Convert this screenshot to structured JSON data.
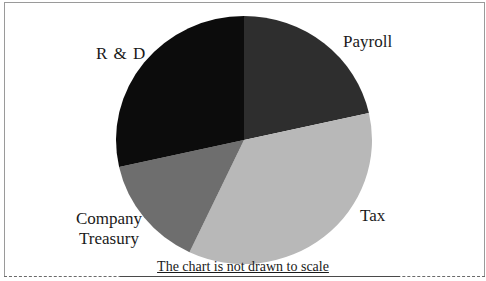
{
  "chart_data": {
    "type": "pie",
    "title": "",
    "categories": [
      "Payroll",
      "Tax",
      "Company Treasury",
      "R & D"
    ],
    "values": [
      21.5,
      35.5,
      14.5,
      28.5
    ],
    "colors": [
      "#2e2e2e",
      "#b8b8b8",
      "#6e6e6e",
      "#0c0c0c"
    ],
    "start_angle_deg": 0,
    "direction": "clockwise",
    "legend": "none (labels placed next to slices)",
    "annotation": "The chart is not drawn to scale"
  },
  "labels": {
    "rd": "R & D",
    "payroll": "Payroll",
    "tax": "Tax",
    "treasury_line1": "Company",
    "treasury_line2": "Treasury"
  },
  "caption": "The chart is not drawn to scale"
}
